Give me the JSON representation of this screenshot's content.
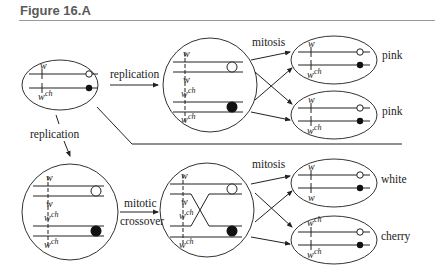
{
  "figure": {
    "title": "Figure 16.A"
  },
  "labels": {
    "gene_w": "w",
    "gene_wch_base": "w",
    "gene_wch_sup": "ch"
  },
  "processes": {
    "replication_top": "replication",
    "replication_left": "replication",
    "mitosis_top": "mitosis",
    "mitosis_bottom": "mitosis",
    "mitotic_crossover_line1": "mitotic",
    "mitotic_crossover_line2": "crossover"
  },
  "phenotypes": {
    "top_1": "pink",
    "top_2": "pink",
    "bottom_1": "white",
    "bottom_2": "cherry"
  },
  "cells": {
    "parent": {
      "chromosomes": [
        [
          "w",
          "open-centromere"
        ],
        [
          "wch",
          "filled-centromere"
        ]
      ]
    },
    "top_replicated": {
      "chromatids": [
        "w",
        "w",
        "wch",
        "wch"
      ]
    },
    "top_daughter_1": {
      "alleles": [
        "w",
        "wch"
      ],
      "phenotype": "pink"
    },
    "top_daughter_2": {
      "alleles": [
        "w",
        "wch"
      ],
      "phenotype": "pink"
    },
    "bottom_replicated": {
      "chromatids": [
        "w",
        "w",
        "wch",
        "wch"
      ]
    },
    "bottom_crossover": {
      "chromatids": [
        "w",
        "w",
        "wch",
        "wch"
      ],
      "crossover": "between chromatid 2 and 3"
    },
    "bottom_daughter_1": {
      "alleles": [
        "w",
        "w"
      ],
      "phenotype": "white"
    },
    "bottom_daughter_2": {
      "alleles": [
        "wch",
        "wch"
      ],
      "phenotype": "cherry"
    }
  }
}
